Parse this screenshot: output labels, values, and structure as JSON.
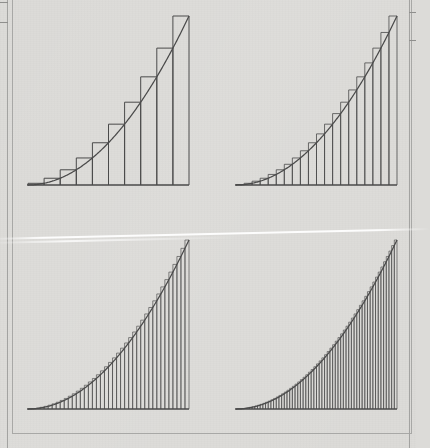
{
  "document": {
    "type": "scanned-textbook-page",
    "background_color": "#dcdbd8",
    "ink_color": "#4a4a4a",
    "page_border_color": "#a8a8a6",
    "artifacts": {
      "left_margin_rule": "vertical-rule",
      "right_margin_rule": "vertical-rule",
      "scan_streak": "white-diagonal-streak"
    }
  },
  "figure": {
    "caption": "",
    "layout": "2x2-grid",
    "panel_order": [
      "top-left",
      "top-right",
      "bottom-left",
      "bottom-right"
    ]
  },
  "chart_data": [
    {
      "type": "bar",
      "title": "",
      "subtitle": "Right-endpoint Riemann sum, n = 10",
      "panel": "top-left",
      "n": 10,
      "rule": "right-endpoint",
      "function": "y = x^2",
      "xlabel": "",
      "ylabel": "",
      "xlim": [
        0,
        1
      ],
      "ylim": [
        0,
        1
      ],
      "grid": false,
      "legend": "none",
      "x": [
        0.1,
        0.2,
        0.3,
        0.4,
        0.5,
        0.6,
        0.7,
        0.8,
        0.9,
        1.0
      ],
      "values": [
        0.01,
        0.04,
        0.09,
        0.16,
        0.25,
        0.36,
        0.49,
        0.64,
        0.81,
        1.0
      ],
      "curve": {
        "name": "y = x^2",
        "x": [
          0,
          0.05,
          0.1,
          0.15,
          0.2,
          0.25,
          0.3,
          0.35,
          0.4,
          0.45,
          0.5,
          0.55,
          0.6,
          0.65,
          0.7,
          0.75,
          0.8,
          0.85,
          0.9,
          0.95,
          1.0
        ],
        "y": [
          0,
          0.0025,
          0.01,
          0.0225,
          0.04,
          0.0625,
          0.09,
          0.1225,
          0.16,
          0.2025,
          0.25,
          0.3025,
          0.36,
          0.4225,
          0.49,
          0.5625,
          0.64,
          0.7225,
          0.81,
          0.9025,
          1.0
        ]
      }
    },
    {
      "type": "bar",
      "title": "",
      "subtitle": "Right-endpoint Riemann sum, n = 20",
      "panel": "top-right",
      "n": 20,
      "rule": "right-endpoint",
      "function": "y = x^2",
      "xlabel": "",
      "ylabel": "",
      "xlim": [
        0,
        1
      ],
      "ylim": [
        0,
        1
      ],
      "grid": false,
      "legend": "none",
      "curve": {
        "name": "y = x^2"
      }
    },
    {
      "type": "bar",
      "title": "",
      "subtitle": "Right-endpoint Riemann sum, n = 40",
      "panel": "bottom-left",
      "n": 40,
      "rule": "right-endpoint",
      "function": "y = x^2",
      "xlabel": "",
      "ylabel": "",
      "xlim": [
        0,
        1
      ],
      "ylim": [
        0,
        1
      ],
      "grid": false,
      "legend": "none",
      "curve": {
        "name": "y = x^2"
      }
    },
    {
      "type": "bar",
      "title": "",
      "subtitle": "Right-endpoint Riemann sum, n = 60",
      "panel": "bottom-right",
      "n": 60,
      "rule": "right-endpoint",
      "function": "y = x^2",
      "xlabel": "",
      "ylabel": "",
      "xlim": [
        0,
        1
      ],
      "ylim": [
        0,
        1
      ],
      "grid": false,
      "legend": "none",
      "curve": {
        "name": "y = x^2"
      }
    }
  ]
}
